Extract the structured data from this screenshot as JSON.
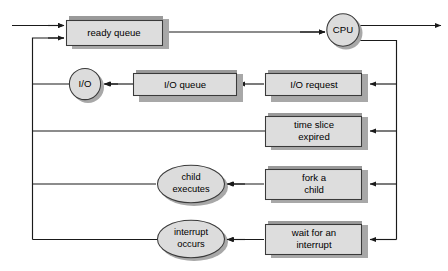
{
  "diagram": {
    "type": "flow-diagram",
    "colors": {
      "node_fill": "#dddddd",
      "node_stroke": "#3a3a3a",
      "shadow": "#a8a8a8",
      "top_band": "#9a9a9a",
      "connector": "#1a1a1a",
      "background": "#ffffff"
    },
    "nodes": {
      "ready_queue": {
        "label": "ready queue",
        "shape": "box"
      },
      "cpu": {
        "label": "CPU",
        "shape": "circle"
      },
      "io": {
        "label": "I/O",
        "shape": "circle"
      },
      "io_queue": {
        "label": "I/O queue",
        "shape": "box"
      },
      "io_request": {
        "label": "I/O request",
        "shape": "box"
      },
      "time_slice": {
        "label_line1": "time slice",
        "label_line2": "expired",
        "shape": "box"
      },
      "child_executes": {
        "label_line1": "child",
        "label_line2": "executes",
        "shape": "ellipse"
      },
      "fork_child": {
        "label_line1": "fork a",
        "label_line2": "child",
        "shape": "box"
      },
      "interrupt_occurs": {
        "label_line1": "interrupt",
        "label_line2": "occurs",
        "shape": "ellipse"
      },
      "wait_interrupt": {
        "label_line1": "wait for an",
        "label_line2": "interrupt",
        "shape": "box"
      }
    },
    "edges": [
      {
        "name": "entry-to-ready-queue",
        "from": "entry",
        "to": "ready_queue"
      },
      {
        "name": "ready-queue-to-cpu",
        "from": "ready_queue",
        "to": "cpu"
      },
      {
        "name": "cpu-to-exit",
        "from": "cpu",
        "to": "exit"
      },
      {
        "name": "cpu-to-io-request",
        "from": "cpu",
        "to": "io_request"
      },
      {
        "name": "io-request-to-io-queue",
        "from": "io_request",
        "to": "io_queue"
      },
      {
        "name": "io-queue-to-io",
        "from": "io_queue",
        "to": "io"
      },
      {
        "name": "io-to-ready-queue",
        "from": "io",
        "to": "ready_queue"
      },
      {
        "name": "cpu-to-time-slice-expired",
        "from": "cpu",
        "to": "time_slice"
      },
      {
        "name": "time-slice-to-ready-queue",
        "from": "time_slice",
        "to": "ready_queue"
      },
      {
        "name": "cpu-to-fork-a-child",
        "from": "cpu",
        "to": "fork_child"
      },
      {
        "name": "fork-child-to-child-executes",
        "from": "fork_child",
        "to": "child_executes"
      },
      {
        "name": "child-executes-to-ready-queue",
        "from": "child_executes",
        "to": "ready_queue"
      },
      {
        "name": "cpu-to-wait-for-interrupt",
        "from": "cpu",
        "to": "wait_interrupt"
      },
      {
        "name": "wait-interrupt-to-interrupt-occurs",
        "from": "wait_interrupt",
        "to": "interrupt_occurs"
      },
      {
        "name": "interrupt-occurs-to-ready-queue",
        "from": "interrupt_occurs",
        "to": "ready_queue"
      }
    ]
  }
}
